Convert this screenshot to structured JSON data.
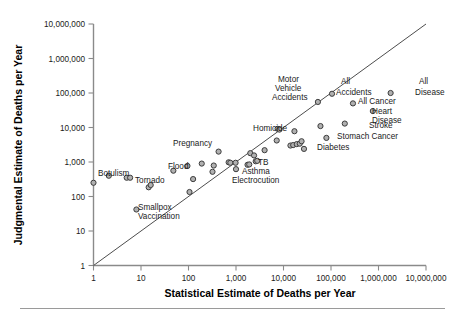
{
  "chart_data": {
    "type": "scatter",
    "title": "",
    "xlabel": "Statistical Estimate of Deaths per Year",
    "ylabel": "Judgmental Estimate of Deaths per Year",
    "xscale": "log",
    "yscale": "log",
    "xlim": [
      1,
      10000000
    ],
    "ylim": [
      1,
      10000000
    ],
    "grid": false,
    "legend": "none",
    "xticklabels": [
      "1",
      "10",
      "100",
      "1,000",
      "10,000",
      "100,000",
      "1,000,000",
      "10,000,000"
    ],
    "yticklabels": [
      "1",
      "10",
      "100",
      "1,000",
      "10,000",
      "100,000",
      "1,000,000",
      "10,000,000"
    ],
    "xtickvalues": [
      1,
      10,
      100,
      1000,
      10000,
      100000,
      1000000,
      10000000
    ],
    "ytickvalues": [
      1,
      10,
      100,
      1000,
      10000,
      100000,
      1000000,
      10000000
    ],
    "reference_line": {
      "label": "identity line",
      "from": [
        1,
        1
      ],
      "to": [
        10000000,
        10000000
      ]
    },
    "points": [
      {
        "x": 1.0,
        "y": 250,
        "label": ""
      },
      {
        "x": 2.1,
        "y": 400,
        "label": "Botulism"
      },
      {
        "x": 5.0,
        "y": 350,
        "label": ""
      },
      {
        "x": 5.9,
        "y": 350,
        "label": ""
      },
      {
        "x": 8.0,
        "y": 42,
        "label": "Smallpox Vaccination"
      },
      {
        "x": 14.5,
        "y": 185,
        "label": ""
      },
      {
        "x": 16.0,
        "y": 215,
        "label": ""
      },
      {
        "x": 48.0,
        "y": 560,
        "label": "Tornado"
      },
      {
        "x": 95.0,
        "y": 770,
        "label": "Flood"
      },
      {
        "x": 105.0,
        "y": 135,
        "label": ""
      },
      {
        "x": 125.0,
        "y": 320,
        "label": ""
      },
      {
        "x": 190.0,
        "y": 900,
        "label": ""
      },
      {
        "x": 320.0,
        "y": 520,
        "label": ""
      },
      {
        "x": 340.0,
        "y": 790,
        "label": ""
      },
      {
        "x": 430.0,
        "y": 2000,
        "label": "Pregnancy"
      },
      {
        "x": 700.0,
        "y": 980,
        "label": ""
      },
      {
        "x": 760.0,
        "y": 950,
        "label": ""
      },
      {
        "x": 980.0,
        "y": 950,
        "label": ""
      },
      {
        "x": 1000.0,
        "y": 620,
        "label": "Electrocution"
      },
      {
        "x": 1750.0,
        "y": 830,
        "label": ""
      },
      {
        "x": 1900.0,
        "y": 850,
        "label": ""
      },
      {
        "x": 2000.0,
        "y": 1800,
        "label": ""
      },
      {
        "x": 2400.0,
        "y": 1550,
        "label": ""
      },
      {
        "x": 2600.0,
        "y": 1050,
        "label": "Asthma"
      },
      {
        "x": 2800.0,
        "y": 1080,
        "label": "TB"
      },
      {
        "x": 4000.0,
        "y": 2200,
        "label": ""
      },
      {
        "x": 7200.0,
        "y": 4200,
        "label": ""
      },
      {
        "x": 7500.0,
        "y": 9200,
        "label": "Homicide"
      },
      {
        "x": 8200.0,
        "y": 8700,
        "label": ""
      },
      {
        "x": 14000.0,
        "y": 3000,
        "label": ""
      },
      {
        "x": 16000.0,
        "y": 3100,
        "label": ""
      },
      {
        "x": 17000.0,
        "y": 7800,
        "label": ""
      },
      {
        "x": 19000.0,
        "y": 3300,
        "label": ""
      },
      {
        "x": 22000.0,
        "y": 3400,
        "label": ""
      },
      {
        "x": 24000.0,
        "y": 4000,
        "label": ""
      },
      {
        "x": 27000.0,
        "y": 2400,
        "label": "Diabetes"
      },
      {
        "x": 53000.0,
        "y": 55000,
        "label": "Motor Vehicle Accidents"
      },
      {
        "x": 60000.0,
        "y": 11000,
        "label": ""
      },
      {
        "x": 80000.0,
        "y": 5000,
        "label": "Stomach Cancer"
      },
      {
        "x": 105000.0,
        "y": 95000,
        "label": "All Accidents"
      },
      {
        "x": 195000.0,
        "y": 13000,
        "label": "Stroke"
      },
      {
        "x": 290000.0,
        "y": 50000,
        "label": "All Cancer"
      },
      {
        "x": 760000.0,
        "y": 30000,
        "label": "Heart Disease"
      },
      {
        "x": 1800000.0,
        "y": 100000,
        "label": "All Disease"
      }
    ],
    "annotations": [
      {
        "text": "Botulism",
        "px": 98,
        "py": 176,
        "anchor": "start"
      },
      {
        "text": "Tornado",
        "px": 135,
        "py": 183,
        "anchor": "start"
      },
      {
        "text": "Smallpox",
        "px": 138,
        "py": 210,
        "anchor": "start"
      },
      {
        "text": "Vaccination",
        "px": 138,
        "py": 219,
        "anchor": "start"
      },
      {
        "text": "Flood",
        "px": 168,
        "py": 169,
        "anchor": "start"
      },
      {
        "text": "Pregnancy",
        "px": 173,
        "py": 146,
        "anchor": "start"
      },
      {
        "text": "Electrocution",
        "px": 232,
        "py": 183,
        "anchor": "start"
      },
      {
        "text": "Asthma",
        "px": 242,
        "py": 174,
        "anchor": "start"
      },
      {
        "text": "TB",
        "px": 258,
        "py": 165,
        "anchor": "start"
      },
      {
        "text": "Homicide",
        "px": 253,
        "py": 131,
        "anchor": "start"
      },
      {
        "text": "Motor",
        "px": 278,
        "py": 82,
        "anchor": "start"
      },
      {
        "text": "Vehicle",
        "px": 275,
        "py": 91,
        "anchor": "start"
      },
      {
        "text": "Accidents",
        "px": 272,
        "py": 100,
        "anchor": "start"
      },
      {
        "text": "Diabetes",
        "px": 317,
        "py": 150,
        "anchor": "start"
      },
      {
        "text": "All",
        "px": 341,
        "py": 84,
        "anchor": "start"
      },
      {
        "text": "Accidents",
        "px": 336,
        "py": 95,
        "anchor": "start"
      },
      {
        "text": "All Cancer",
        "px": 358,
        "py": 104,
        "anchor": "start"
      },
      {
        "text": "Stroke",
        "px": 369,
        "py": 128,
        "anchor": "start"
      },
      {
        "text": "Stomach Cancer",
        "px": 337,
        "py": 139,
        "anchor": "start"
      },
      {
        "text": "Heart",
        "px": 372,
        "py": 114,
        "anchor": "start"
      },
      {
        "text": "Disease",
        "px": 372,
        "py": 123,
        "anchor": "start"
      },
      {
        "text": "All",
        "px": 419,
        "py": 84,
        "anchor": "start"
      },
      {
        "text": "Disease",
        "px": 415,
        "py": 95,
        "anchor": "start"
      }
    ]
  },
  "figure": {
    "footer_rule_visible": true
  }
}
